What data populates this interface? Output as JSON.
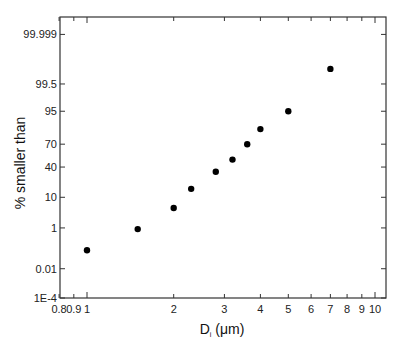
{
  "chart_data": {
    "type": "scatter",
    "title": "",
    "xlabel": "D",
    "xlabel_sub": "i",
    "xlabel_unit": " (μm)",
    "ylabel": "% smaller than",
    "xscale": "log",
    "yscale": "probability",
    "xlim": [
      0.8,
      11
    ],
    "ylim": [
      0.0001,
      99.9999
    ],
    "grid": false,
    "legend": null,
    "x_ticks": [
      0.8,
      0.9,
      1,
      2,
      3,
      4,
      5,
      6,
      7,
      8,
      9,
      10
    ],
    "x_tick_labels": [
      "0.8",
      "0.9",
      "1",
      "2",
      "3",
      "4",
      "5",
      "6",
      "7",
      "8",
      "9",
      "10"
    ],
    "y_ticks": [
      0.0001,
      0.01,
      1,
      10,
      40,
      70,
      95,
      99.5,
      99.999
    ],
    "y_tick_labels": [
      "1E-4",
      "0.01",
      "1",
      "10",
      "40",
      "70",
      "95",
      "99.5",
      "99.999"
    ],
    "series": [
      {
        "name": "data",
        "marker": "filled-circle",
        "color": "#000000",
        "x": [
          1.0,
          1.5,
          2.0,
          2.3,
          2.8,
          3.2,
          3.6,
          4.0,
          5.0,
          7.0
        ],
        "y": [
          0.1,
          0.9,
          5,
          16,
          34,
          50,
          70,
          85,
          95,
          99.9
        ]
      }
    ]
  }
}
